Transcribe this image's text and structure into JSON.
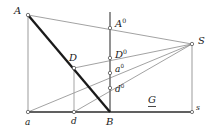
{
  "figure": {
    "type": "geometric-construction-diagram",
    "width": 211,
    "height": 132,
    "background_color": "#ffffff",
    "line_color_thin": "#8a8a8a",
    "line_color_medium": "#6e6e6e",
    "line_color_thick": "#1a1a1a",
    "baseline_color": "#2b2b2b",
    "marker_fill": "#ffffff",
    "marker_stroke": "#555555",
    "text_color": "#1a1a1a"
  },
  "points": {
    "A": {
      "label": "A",
      "sup": "",
      "x": 28,
      "y": 15,
      "label_x": 14,
      "label_y": 6,
      "style": "cap"
    },
    "S": {
      "label": "S",
      "sup": "",
      "x": 192,
      "y": 44,
      "label_x": 198,
      "label_y": 36,
      "style": "cap"
    },
    "D": {
      "label": "D",
      "sup": "",
      "x": 74,
      "y": 68,
      "label_x": 69,
      "label_y": 53,
      "style": "cap"
    },
    "B": {
      "label": "B",
      "sup": "",
      "x": 110,
      "y": 112,
      "label_x": 106,
      "label_y": 117,
      "style": "cap"
    },
    "a": {
      "label": "a",
      "sup": "",
      "x": 28,
      "y": 112,
      "label_x": 25,
      "label_y": 118,
      "style": "low"
    },
    "d": {
      "label": "d",
      "sup": "",
      "x": 74,
      "y": 112,
      "label_x": 71,
      "label_y": 117,
      "style": "low"
    },
    "s": {
      "label": "s",
      "sup": "",
      "x": 192,
      "y": 112,
      "label_x": 196,
      "label_y": 104,
      "style": "s-small"
    },
    "A0": {
      "label": "A",
      "sup": "0",
      "x": 110,
      "y": 28,
      "label_x": 115,
      "label_y": 18,
      "style": "cap"
    },
    "D0": {
      "label": "D",
      "sup": "0",
      "x": 110,
      "y": 58,
      "label_x": 115,
      "label_y": 49,
      "style": "cap"
    },
    "a0": {
      "label": "a",
      "sup": "0",
      "x": 110,
      "y": 73,
      "label_x": 115,
      "label_y": 64,
      "style": "low"
    },
    "d0": {
      "label": "d",
      "sup": "0",
      "x": 110,
      "y": 88,
      "label_x": 115,
      "label_y": 84,
      "style": "low"
    },
    "G": {
      "label": "G",
      "sup": "",
      "x": 152,
      "y": 112,
      "label_x": 148,
      "label_y": 95,
      "style": "G"
    }
  },
  "segments": [
    {
      "name": "baseline-a-to-s",
      "from": "a",
      "to": "s",
      "weight": "baseline"
    },
    {
      "name": "vertical-A-to-a",
      "from": "A",
      "to": "a",
      "weight": "thin"
    },
    {
      "name": "vertical-S-to-s",
      "from": "S",
      "to": "s",
      "weight": "thin"
    },
    {
      "name": "vertical-D-to-d",
      "from": "D",
      "to": "d",
      "weight": "thin"
    },
    {
      "name": "vertical-axis-at-B",
      "from": "top-axis",
      "to": "B",
      "weight": "medium"
    },
    {
      "name": "ray-A-to-S",
      "from": "A",
      "to": "S",
      "weight": "thin"
    },
    {
      "name": "ray-D-to-S",
      "from": "D",
      "to": "S",
      "weight": "thin"
    },
    {
      "name": "ray-a-to-S",
      "from": "a",
      "to": "S",
      "weight": "thin"
    },
    {
      "name": "ray-d-to-S",
      "from": "d",
      "to": "S",
      "weight": "thin"
    },
    {
      "name": "chord-A-to-B",
      "from": "A",
      "to": "B",
      "weight": "thick"
    }
  ],
  "axis": {
    "vertical_top_y": 12,
    "vertical_x": 110
  },
  "caption": ""
}
